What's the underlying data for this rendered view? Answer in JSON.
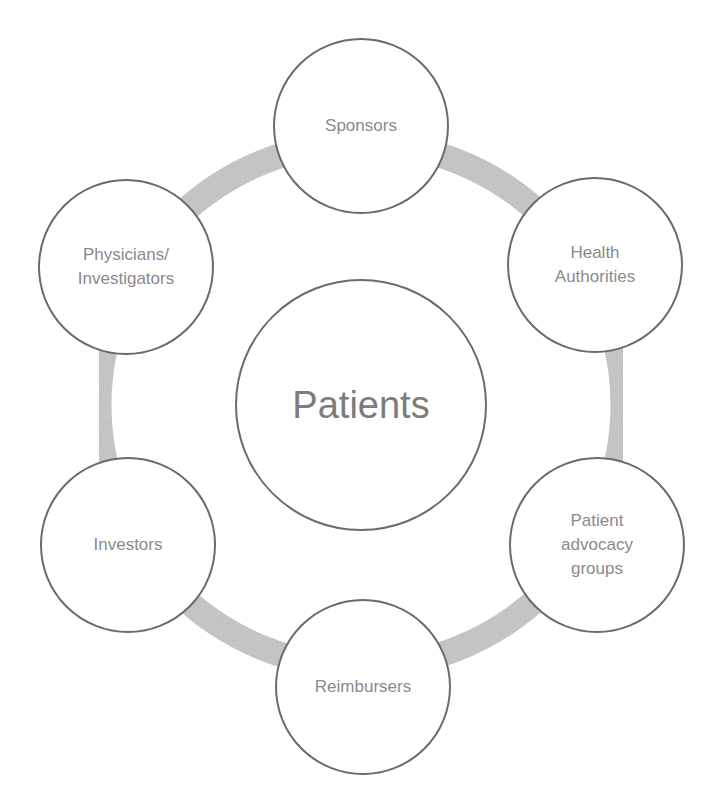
{
  "diagram": {
    "center": {
      "label": "Patients",
      "cx": 361,
      "cy": 405,
      "r": 126
    },
    "ring": {
      "cx": 361,
      "cy": 405,
      "r": 262,
      "stroke_width": 25,
      "color": "#c6c6c6"
    },
    "node_border_color": "#6b6b6b",
    "text_color": "#8a8a8a",
    "nodes": [
      {
        "id": "sponsors",
        "label": "Sponsors",
        "cx": 361,
        "cy": 126,
        "r": 88
      },
      {
        "id": "health-authorities",
        "label": "Health\nAuthorities",
        "cx": 595,
        "cy": 265,
        "r": 88
      },
      {
        "id": "patient-advocacy-groups",
        "label": "Patient\nadvocacy\ngroups",
        "cx": 597,
        "cy": 545,
        "r": 88
      },
      {
        "id": "reimbursers",
        "label": "Reimbursers",
        "cx": 363,
        "cy": 687,
        "r": 88
      },
      {
        "id": "investors",
        "label": "Investors",
        "cx": 128,
        "cy": 545,
        "r": 88
      },
      {
        "id": "physicians-investigators",
        "label": "Physicians/\nInvestigators",
        "cx": 126,
        "cy": 267,
        "r": 88
      }
    ]
  }
}
